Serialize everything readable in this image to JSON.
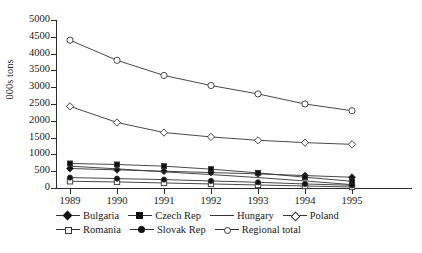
{
  "chart": {
    "title": "",
    "ylabel": "000s tons"
  },
  "chart_data": {
    "type": "line",
    "title": "",
    "xlabel": "",
    "ylabel": "000s tons",
    "grid": false,
    "legend_position": "bottom",
    "x": [
      1989,
      1990,
      1991,
      1992,
      1993,
      1994,
      1995
    ],
    "xtick_labels": [
      "1989",
      "1990",
      "1991",
      "1992",
      "1993",
      "1994",
      "1995"
    ],
    "ylim": [
      0,
      5000
    ],
    "ytick_labels": [
      "0",
      "500",
      "1000",
      "1500",
      "2000",
      "2500",
      "3000",
      "3500",
      "4000",
      "4500",
      "5000"
    ],
    "yticks": [
      0,
      500,
      1000,
      1500,
      2000,
      2500,
      3000,
      3500,
      4000,
      4500,
      5000
    ],
    "series": [
      {
        "name": "Bulgaria",
        "marker": "filled-diamond",
        "values": [
          580,
          540,
          500,
          460,
          420,
          370,
          320
        ]
      },
      {
        "name": "Czech Rep",
        "marker": "filled-square",
        "values": [
          730,
          700,
          650,
          560,
          450,
          320,
          200
        ]
      },
      {
        "name": "Hungary",
        "marker": "none",
        "values": [
          650,
          570,
          480,
          400,
          310,
          210,
          100
        ]
      },
      {
        "name": "Poland",
        "marker": "open-diamond",
        "values": [
          2430,
          1950,
          1650,
          1520,
          1420,
          1350,
          1300
        ]
      },
      {
        "name": "Romania",
        "marker": "open-square",
        "values": [
          200,
          180,
          150,
          120,
          90,
          60,
          30
        ]
      },
      {
        "name": "Slovak Rep",
        "marker": "filled-circle",
        "values": [
          310,
          280,
          250,
          210,
          170,
          120,
          80
        ]
      },
      {
        "name": "Regional total",
        "marker": "open-circle",
        "values": [
          4400,
          3800,
          3350,
          3050,
          2800,
          2500,
          2300
        ]
      }
    ]
  },
  "legend": {
    "row1": [
      {
        "label": "Bulgaria",
        "marker": "filled-diamond"
      },
      {
        "label": "Czech Rep",
        "marker": "filled-square"
      },
      {
        "label": "Hungary",
        "marker": "none"
      },
      {
        "label": "Poland",
        "marker": "open-diamond"
      }
    ],
    "row2": [
      {
        "label": "Romania",
        "marker": "open-square"
      },
      {
        "label": "Slovak Rep",
        "marker": "filled-circle"
      },
      {
        "label": "Regional total",
        "marker": "open-circle"
      }
    ]
  }
}
